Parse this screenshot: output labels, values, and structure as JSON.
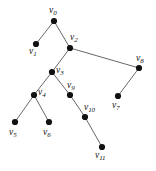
{
  "figure": {
    "type": "tree-diagram",
    "width": 156,
    "height": 171,
    "background_color": "#ffffff",
    "edge_color": "#565656",
    "node_color": "#111111",
    "node_radius": 3.1
  },
  "graph_data": {
    "type": "tree",
    "node_count": 12,
    "edge_count": 11,
    "root": "v0",
    "nodes": [
      {
        "id": "v0",
        "name": "v",
        "sub": "0",
        "x": 54,
        "y": 21,
        "label_x": 49,
        "label_y": 6,
        "label": "v0"
      },
      {
        "id": "v1",
        "name": "v",
        "sub": "1",
        "x": 36,
        "y": 44,
        "label_x": 29,
        "label_y": 47,
        "label": "v1"
      },
      {
        "id": "v2",
        "name": "v",
        "sub": "2",
        "x": 70,
        "y": 48,
        "label_x": 70,
        "label_y": 33,
        "label": "v2"
      },
      {
        "id": "v3",
        "name": "v",
        "sub": "3",
        "x": 52,
        "y": 72,
        "label_x": 56,
        "label_y": 66,
        "label": "v3"
      },
      {
        "id": "v4",
        "name": "v",
        "sub": "4",
        "x": 34,
        "y": 95,
        "label_x": 38,
        "label_y": 88,
        "label": "v4"
      },
      {
        "id": "v5",
        "name": "v",
        "sub": "5",
        "x": 15,
        "y": 122,
        "label_x": 9,
        "label_y": 128,
        "label": "v5"
      },
      {
        "id": "v6",
        "name": "v",
        "sub": "6",
        "x": 49,
        "y": 122,
        "label_x": 43,
        "label_y": 128,
        "label": "v6"
      },
      {
        "id": "v7",
        "name": "v",
        "sub": "7",
        "x": 118,
        "y": 96,
        "label_x": 112,
        "label_y": 101,
        "label": "v7"
      },
      {
        "id": "v8",
        "name": "v",
        "sub": "8",
        "x": 139,
        "y": 68,
        "label_x": 136,
        "label_y": 54,
        "label": "v8"
      },
      {
        "id": "v9",
        "name": "v",
        "sub": "9",
        "x": 70,
        "y": 95,
        "label_x": 67,
        "label_y": 81,
        "label": "v9"
      },
      {
        "id": "v10",
        "name": "v",
        "sub": "10",
        "x": 85,
        "y": 117,
        "label_x": 84,
        "label_y": 103,
        "label": "v10"
      },
      {
        "id": "v11",
        "name": "v",
        "sub": "11",
        "x": 102,
        "y": 147,
        "label_x": 95,
        "label_y": 151,
        "label": "v11"
      }
    ],
    "edges": [
      {
        "from": "v0",
        "to": "v1"
      },
      {
        "from": "v0",
        "to": "v2"
      },
      {
        "from": "v2",
        "to": "v3"
      },
      {
        "from": "v2",
        "to": "v8"
      },
      {
        "from": "v8",
        "to": "v7"
      },
      {
        "from": "v3",
        "to": "v4"
      },
      {
        "from": "v3",
        "to": "v9"
      },
      {
        "from": "v4",
        "to": "v5"
      },
      {
        "from": "v4",
        "to": "v6"
      },
      {
        "from": "v9",
        "to": "v10"
      },
      {
        "from": "v10",
        "to": "v11"
      }
    ]
  }
}
